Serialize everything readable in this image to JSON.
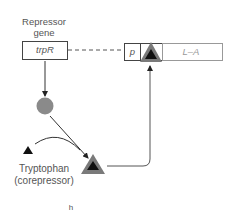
{
  "diagram": {
    "repressor_gene_label": [
      "Repressor",
      "gene"
    ],
    "repressor_gene_name": "trpR",
    "operon": {
      "promoter_label": "p",
      "genes_label": "L–A"
    },
    "corepressor_label": [
      "Tryptophan",
      "(corepressor)"
    ],
    "stray_glyph": "h"
  },
  "colors": {
    "text": "#555555",
    "line": "#333333",
    "box_stroke": "#444444",
    "repressor_fill": "#8a8a8a",
    "complex_outer": "#7a7a7a",
    "complex_inner": "#111111",
    "operon_outline": "#999999"
  }
}
